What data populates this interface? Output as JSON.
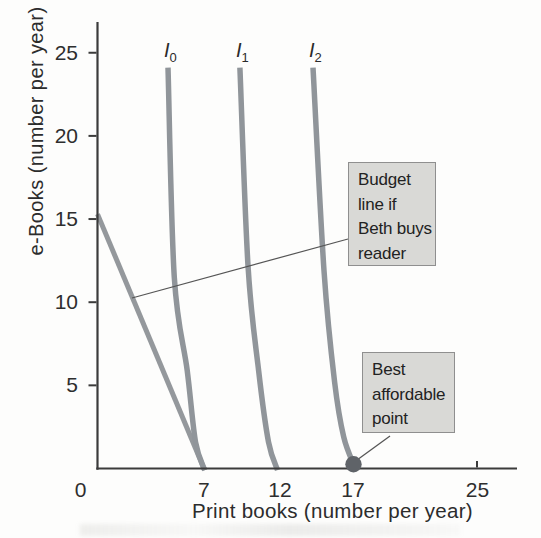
{
  "colors": {
    "curve": "#90959a",
    "budget_line": "#94989c",
    "axis": "#3b3b3b",
    "tick": "#3b3b3b",
    "dot": "#5f6368",
    "box_fill": "#d9d9d6",
    "box_border": "#8f8f8f",
    "callout": "#555555",
    "text": "#222222"
  },
  "chart_data": {
    "type": "line",
    "title": "",
    "xlabel": "Print books (number per year)",
    "ylabel": "e-Books (number per year)",
    "xlim": [
      0,
      27.7
    ],
    "ylim": [
      0,
      26.7
    ],
    "grid": false,
    "legend": "none",
    "x_ticks": [
      {
        "value": 0,
        "label": "0",
        "dx": -17,
        "mark": false
      },
      {
        "value": 7,
        "label": "7",
        "dx": 0,
        "mark": false
      },
      {
        "value": 12,
        "label": "12",
        "dx": 0,
        "mark": false
      },
      {
        "value": 17,
        "label": "17",
        "dx": -3,
        "mark": false
      },
      {
        "value": 25,
        "label": "25",
        "dx": 0,
        "mark": true
      }
    ],
    "y_ticks": [
      {
        "value": 5,
        "label": "5"
      },
      {
        "value": 10,
        "label": "10"
      },
      {
        "value": 15,
        "label": "15"
      },
      {
        "value": 20,
        "label": "20"
      },
      {
        "value": 25,
        "label": "25"
      }
    ],
    "series": [
      {
        "name": "budget_line_if_beth_buys_reader",
        "kind": "budget_line",
        "smooth": false,
        "points": [
          [
            0,
            15.3
          ],
          [
            7.05,
            -0.1
          ]
        ],
        "annotation": "Budget\nline if\nBeth buys\nreader"
      },
      {
        "name": "indifference_curve_I0",
        "kind": "indifference_curve",
        "label": {
          "base": "I",
          "sub": "0"
        },
        "smooth": true,
        "points": [
          [
            4.64,
            24.1
          ],
          [
            5.05,
            11.5
          ],
          [
            5.9,
            5.9
          ],
          [
            6.45,
            1.6
          ],
          [
            7.05,
            -0.1
          ]
        ]
      },
      {
        "name": "indifference_curve_I1",
        "kind": "indifference_curve",
        "label": {
          "base": "I",
          "sub": "1"
        },
        "smooth": true,
        "points": [
          [
            9.37,
            24.1
          ],
          [
            9.9,
            12.2
          ],
          [
            10.6,
            5.9
          ],
          [
            11.25,
            1.6
          ],
          [
            11.85,
            -0.1
          ]
        ]
      },
      {
        "name": "indifference_curve_I2",
        "kind": "indifference_curve",
        "label": {
          "base": "I",
          "sub": "2"
        },
        "smooth": true,
        "points": [
          [
            14.18,
            24.1
          ],
          [
            14.9,
            11.9
          ],
          [
            15.6,
            5.2
          ],
          [
            16.2,
            1.9
          ],
          [
            16.9,
            0.15
          ]
        ]
      }
    ],
    "best_affordable_point": {
      "x": 17,
      "y": 0,
      "annotation": "Best\naffordable\npoint"
    }
  }
}
